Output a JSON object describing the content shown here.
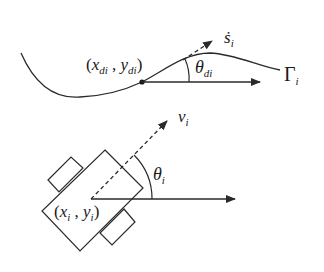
{
  "diagram": {
    "type": "robot path-following kinematics",
    "stroke_color": "#2a2a2a",
    "background": "#ffffff",
    "top": {
      "path_label": {
        "base": "Γ",
        "sub": "i"
      },
      "desired_point_label": {
        "open": "(",
        "x": "x",
        "x_sub": "di",
        "sep": " , ",
        "y": "y",
        "y_sub": "di",
        "close": ")"
      },
      "tangent_label": {
        "base": "ṡ",
        "sub": "i"
      },
      "angle_label": {
        "base": "θ",
        "sub": "di"
      }
    },
    "bottom": {
      "velocity_label": {
        "base": "v",
        "sub": "i"
      },
      "angle_label": {
        "base": "θ",
        "sub": "i"
      },
      "position_label": {
        "open": "(",
        "x": "x",
        "x_sub": "i",
        "sep": " , ",
        "y": "y",
        "y_sub": "i",
        "close": ")"
      }
    }
  }
}
